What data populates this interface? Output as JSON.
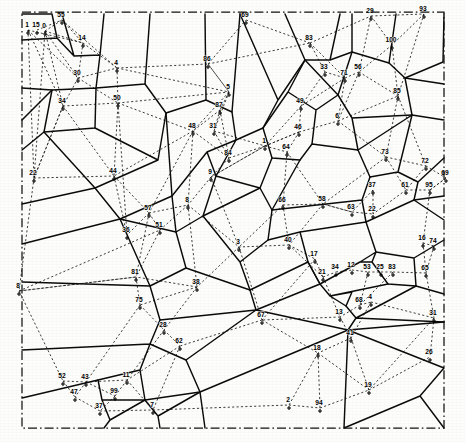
{
  "figure": {
    "type": "voronoi-delaunay-diagram",
    "title": "",
    "width": 465,
    "height": 442,
    "background_color": "#fdfdfb",
    "border": {
      "style": "dash-dot",
      "color": "#121212",
      "x": 22,
      "y": 12,
      "width": 422,
      "height": 416
    },
    "legend": {
      "voronoi_edges": "solid black lines",
      "delaunay_edges": "dotted black lines",
      "sites": "numbered point markers"
    }
  },
  "chart_data": {
    "type": "scatter",
    "title": "",
    "xlabel": "",
    "ylabel": "",
    "xlim": [
      22,
      444
    ],
    "ylim": [
      12,
      428
    ],
    "grid": false,
    "legend_position": "none",
    "series": [
      {
        "name": "sites",
        "points": [
          {
            "id": "1",
            "x": 28,
            "y": 30
          },
          {
            "id": "15",
            "x": 37,
            "y": 30
          },
          {
            "id": "0",
            "x": 45,
            "y": 31
          },
          {
            "id": "55",
            "x": 62,
            "y": 20
          },
          {
            "id": "14",
            "x": 83,
            "y": 43
          },
          {
            "id": "30",
            "x": 78,
            "y": 78
          },
          {
            "id": "4",
            "x": 117,
            "y": 68
          },
          {
            "id": "34",
            "x": 63,
            "y": 106
          },
          {
            "id": "50",
            "x": 118,
            "y": 103
          },
          {
            "id": "86",
            "x": 208,
            "y": 64
          },
          {
            "id": "5",
            "x": 229,
            "y": 92
          },
          {
            "id": "87",
            "x": 220,
            "y": 110
          },
          {
            "id": "48",
            "x": 193,
            "y": 131
          },
          {
            "id": "31",
            "x": 214,
            "y": 131
          },
          {
            "id": "84",
            "x": 229,
            "y": 158
          },
          {
            "id": "9",
            "x": 211,
            "y": 177
          },
          {
            "id": "22",
            "x": 34,
            "y": 178
          },
          {
            "id": "44",
            "x": 114,
            "y": 176
          },
          {
            "id": "8",
            "x": 188,
            "y": 205
          },
          {
            "id": "57",
            "x": 149,
            "y": 213
          },
          {
            "id": "36",
            "x": 127,
            "y": 235
          },
          {
            "id": "51",
            "x": 160,
            "y": 230
          },
          {
            "id": "3",
            "x": 239,
            "y": 247
          },
          {
            "id": "69",
            "x": 246,
            "y": 20
          },
          {
            "id": "83",
            "x": 310,
            "y": 43
          },
          {
            "id": "29",
            "x": 371,
            "y": 16
          },
          {
            "id": "93",
            "x": 424,
            "y": 14
          },
          {
            "id": "100",
            "x": 392,
            "y": 45
          },
          {
            "id": "33",
            "x": 325,
            "y": 72
          },
          {
            "id": "71",
            "x": 345,
            "y": 78
          },
          {
            "id": "56",
            "x": 359,
            "y": 72
          },
          {
            "id": "49",
            "x": 301,
            "y": 106
          },
          {
            "id": "85",
            "x": 398,
            "y": 96
          },
          {
            "id": "46",
            "x": 299,
            "y": 132
          },
          {
            "id": "6",
            "x": 338,
            "y": 121
          },
          {
            "id": "1b",
            "x": 265,
            "y": 146
          },
          {
            "id": "64",
            "x": 287,
            "y": 152
          },
          {
            "id": "73",
            "x": 386,
            "y": 157
          },
          {
            "id": "72",
            "x": 426,
            "y": 166
          },
          {
            "id": "66",
            "x": 283,
            "y": 205
          },
          {
            "id": "58",
            "x": 323,
            "y": 204
          },
          {
            "id": "63",
            "x": 352,
            "y": 212
          },
          {
            "id": "61",
            "x": 406,
            "y": 190
          },
          {
            "id": "69b",
            "x": 446,
            "y": 178
          },
          {
            "id": "37",
            "x": 373,
            "y": 190
          },
          {
            "id": "22b",
            "x": 373,
            "y": 214
          },
          {
            "id": "95",
            "x": 430,
            "y": 190
          },
          {
            "id": "40",
            "x": 289,
            "y": 245
          },
          {
            "id": "16",
            "x": 423,
            "y": 243
          },
          {
            "id": "74",
            "x": 434,
            "y": 246
          },
          {
            "id": "17",
            "x": 315,
            "y": 259
          },
          {
            "id": "21",
            "x": 323,
            "y": 277
          },
          {
            "id": "34b",
            "x": 336,
            "y": 272
          },
          {
            "id": "12",
            "x": 352,
            "y": 270
          },
          {
            "id": "53",
            "x": 368,
            "y": 272
          },
          {
            "id": "25",
            "x": 381,
            "y": 272
          },
          {
            "id": "83b",
            "x": 393,
            "y": 272
          },
          {
            "id": "65",
            "x": 426,
            "y": 273
          },
          {
            "id": "68",
            "x": 360,
            "y": 305
          },
          {
            "id": "4b",
            "x": 371,
            "y": 302
          },
          {
            "id": "13",
            "x": 340,
            "y": 317
          },
          {
            "id": "31b",
            "x": 434,
            "y": 318
          },
          {
            "id": "67",
            "x": 262,
            "y": 320
          },
          {
            "id": "41",
            "x": 351,
            "y": 338
          },
          {
            "id": "26",
            "x": 430,
            "y": 357
          },
          {
            "id": "38",
            "x": 197,
            "y": 287
          },
          {
            "id": "28",
            "x": 164,
            "y": 330
          },
          {
            "id": "75",
            "x": 140,
            "y": 305
          },
          {
            "id": "81",
            "x": 136,
            "y": 277
          },
          {
            "id": "8b",
            "x": 19,
            "y": 291
          },
          {
            "id": "62",
            "x": 180,
            "y": 346
          },
          {
            "id": "52",
            "x": 63,
            "y": 381
          },
          {
            "id": "43",
            "x": 86,
            "y": 382
          },
          {
            "id": "11",
            "x": 127,
            "y": 380
          },
          {
            "id": "47",
            "x": 75,
            "y": 397
          },
          {
            "id": "99",
            "x": 115,
            "y": 396
          },
          {
            "id": "37b",
            "x": 100,
            "y": 411
          },
          {
            "id": "7",
            "x": 153,
            "y": 410
          },
          {
            "id": "2",
            "x": 289,
            "y": 405
          },
          {
            "id": "94",
            "x": 320,
            "y": 408
          },
          {
            "id": "19",
            "x": 369,
            "y": 390
          },
          {
            "id": "18",
            "x": 318,
            "y": 353
          }
        ]
      }
    ],
    "site_count": 84
  },
  "labels": {
    "visible_numbers": [
      "0",
      "1",
      "2",
      "3",
      "4",
      "5",
      "6",
      "7",
      "8",
      "9",
      "11",
      "12",
      "13",
      "14",
      "15",
      "16",
      "17",
      "18",
      "19",
      "21",
      "22",
      "25",
      "26",
      "28",
      "29",
      "30",
      "31",
      "33",
      "34",
      "36",
      "37",
      "38",
      "40",
      "41",
      "43",
      "44",
      "46",
      "47",
      "48",
      "49",
      "50",
      "51",
      "52",
      "53",
      "55",
      "56",
      "57",
      "58",
      "61",
      "62",
      "63",
      "64",
      "65",
      "66",
      "67",
      "68",
      "69",
      "71",
      "72",
      "73",
      "74",
      "75",
      "81",
      "83",
      "84",
      "85",
      "86",
      "87",
      "93",
      "94",
      "95",
      "99",
      "100"
    ]
  }
}
